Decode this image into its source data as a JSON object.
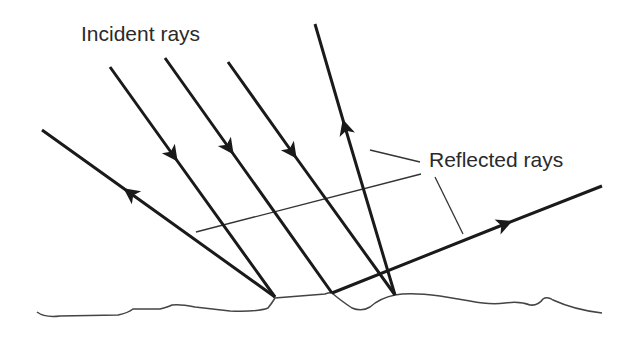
{
  "diagram": {
    "labels": {
      "incident": "Incident rays",
      "reflected": "Reflected rays"
    },
    "colors": {
      "ray": "#1a1a1a",
      "leader": "#333333",
      "surface": "#444444",
      "text": "#2a2a2a",
      "background": "#ffffff"
    },
    "incident_rays": [
      {
        "from": [
          110,
          67
        ],
        "to": [
          275,
          297
        ],
        "arrow_at": [
          173,
          155
        ]
      },
      {
        "from": [
          165,
          58
        ],
        "to": [
          332,
          293
        ],
        "arrow_at": [
          229,
          148
        ]
      },
      {
        "from": [
          228,
          62
        ],
        "to": [
          395,
          295
        ],
        "arrow_at": [
          292,
          152
        ]
      }
    ],
    "reflected_rays": [
      {
        "from": [
          275,
          297
        ],
        "to": [
          42,
          130
        ],
        "arrow_at": [
          130,
          193
        ]
      },
      {
        "from": [
          395,
          295
        ],
        "to": [
          315,
          24
        ],
        "arrow_at": [
          345,
          127
        ]
      },
      {
        "from": [
          332,
          293
        ],
        "to": [
          602,
          186
        ],
        "arrow_at": [
          505,
          224
        ]
      }
    ],
    "leader_lines": [
      {
        "from": [
          370,
          150
        ],
        "to": [
          420,
          162
        ]
      },
      {
        "from": [
          196,
          232
        ],
        "to": [
          421,
          174
        ]
      },
      {
        "from": [
          435,
          177
        ],
        "to": [
          463,
          234
        ]
      }
    ]
  }
}
